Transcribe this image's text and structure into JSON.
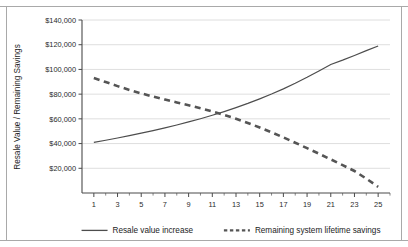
{
  "chart_data": {
    "type": "line",
    "title": "",
    "xlabel": "",
    "ylabel": "Resale Value / Remaining Savings",
    "xlim": [
      0,
      26
    ],
    "ylim": [
      0,
      140000
    ],
    "grid": true,
    "legend_position": "bottom",
    "x_ticks": [
      1,
      3,
      5,
      7,
      9,
      11,
      13,
      15,
      17,
      19,
      21,
      23,
      25
    ],
    "x_tick_labels": [
      "1",
      "3",
      "5",
      "7",
      "9",
      "11",
      "13",
      "15",
      "17",
      "19",
      "21",
      "23",
      "25"
    ],
    "x_minor_ticks": [
      2,
      4,
      6,
      8,
      10,
      12,
      14,
      16,
      18,
      20,
      22,
      24,
      26
    ],
    "y_ticks": [
      20000,
      40000,
      60000,
      80000,
      100000,
      120000,
      140000
    ],
    "y_tick_labels": [
      "$20,000",
      "$40,000",
      "$60,000",
      "$80,000",
      "$100,000",
      "$120,000",
      "$140,000"
    ],
    "x": [
      1,
      2,
      3,
      4,
      5,
      6,
      7,
      8,
      9,
      10,
      11,
      12,
      13,
      14,
      15,
      16,
      17,
      18,
      19,
      20,
      21,
      22,
      23,
      24,
      25
    ],
    "series": [
      {
        "name": "Resale value increase",
        "style": "solid",
        "color": "#4d4d4d",
        "values": [
          41000,
          42700,
          44500,
          46400,
          48400,
          50500,
          52700,
          55000,
          57500,
          60100,
          62900,
          65900,
          69100,
          72500,
          76200,
          80100,
          84300,
          88800,
          93600,
          98700,
          104000,
          107500,
          111300,
          115200,
          119000
        ]
      },
      {
        "name": "Remaining system lifetime savings",
        "style": "dashed",
        "color": "#555555",
        "values": [
          93000,
          89800,
          86500,
          83400,
          80600,
          78000,
          75600,
          73300,
          71000,
          68600,
          66000,
          63200,
          60100,
          56700,
          53000,
          49100,
          45000,
          40700,
          36300,
          31800,
          27200,
          22600,
          17800,
          11600,
          5000
        ]
      }
    ],
    "legend": [
      {
        "label": "Resale value increase",
        "style": "solid"
      },
      {
        "label": "Remaining system lifetime savings",
        "style": "dashed"
      }
    ]
  }
}
